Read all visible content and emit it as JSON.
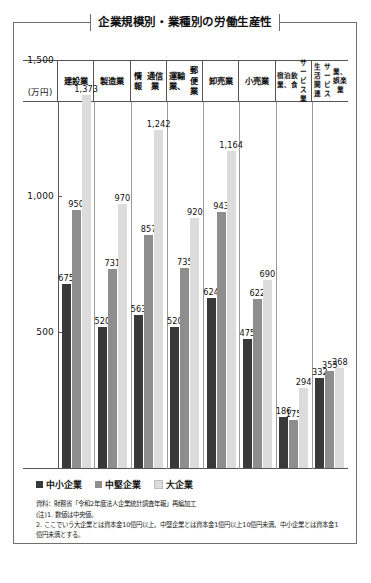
{
  "figure": {
    "title": "企業規模別・業種別の労働生産性",
    "unit_label": "(万円)"
  },
  "chart_data": {
    "type": "bar",
    "title": "企業規模別・業種別の労働生産性",
    "xlabel": "",
    "ylabel": "(万円)",
    "ylim": [
      0,
      1500
    ],
    "yticks": [
      500,
      1000,
      1500
    ],
    "ytick_labels": [
      "500",
      "1,000",
      "1,500"
    ],
    "grid": false,
    "legend_position": "bottom-left",
    "categories": [
      "建設業",
      "製造業",
      "情報通信業",
      "運輸業、郵便業",
      "卸売業",
      "小売業",
      "宿泊業、飲食サービス業",
      "生活関連サービス業、娯楽業"
    ],
    "category_lines": [
      [
        "建設業"
      ],
      [
        "製造業"
      ],
      [
        "情報",
        "通信業"
      ],
      [
        "運輸業、",
        "郵便業"
      ],
      [
        "卸売業"
      ],
      [
        "小売業"
      ],
      [
        "宿泊業、",
        "飲食",
        "サービス業"
      ],
      [
        "生活関連",
        "サービス",
        "業、娯楽業"
      ]
    ],
    "series": [
      {
        "name": "中小企業",
        "color": "#393939",
        "values": [
          675,
          520,
          563,
          520,
          624,
          475,
          186,
          332
        ]
      },
      {
        "name": "中堅企業",
        "color": "#8e8e8e",
        "values": [
          950,
          731,
          857,
          735,
          943,
          622,
          175,
          355
        ]
      },
      {
        "name": "大企業",
        "color": "#dcdcdc",
        "values": [
          1373,
          970,
          1242,
          920,
          1164,
          690,
          294,
          368
        ]
      }
    ],
    "value_labels": [
      [
        "675",
        "950",
        "1,373"
      ],
      [
        "520",
        "731",
        "970"
      ],
      [
        "563",
        "857",
        "1,242"
      ],
      [
        "520",
        "735",
        "920"
      ],
      [
        "624",
        "943",
        "1,164"
      ],
      [
        "475",
        "622",
        "690"
      ],
      [
        "186",
        "175",
        "294"
      ],
      [
        "332",
        "355",
        "368"
      ]
    ]
  },
  "legend": {
    "items": [
      {
        "label": "中小企業",
        "color": "#393939"
      },
      {
        "label": "中堅企業",
        "color": "#8e8e8e"
      },
      {
        "label": "大企業",
        "color": "#dcdcdc"
      }
    ]
  },
  "notes": {
    "source": "資料：財務省「令和2年度法人企業統計調査年報」再編加工",
    "note1": "(注)1. 数値は中央値。",
    "note2": "2. ここでいう大企業とは資本金10億円以上、中堅企業とは資本金1億円以上10億円未満、中小企業とは資本金1億円未満とする。"
  }
}
